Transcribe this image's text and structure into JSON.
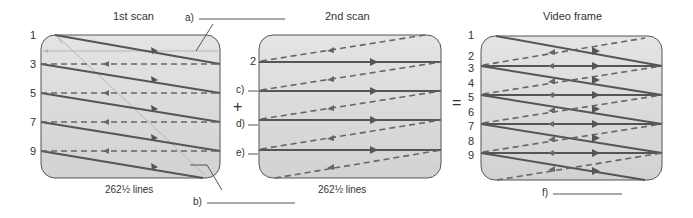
{
  "panels": [
    {
      "title": "1st scan",
      "caption": "262½ lines",
      "line_numbers": [
        "1",
        "3",
        "5",
        "7",
        "9"
      ]
    },
    {
      "title": "2nd scan",
      "caption": "262½ lines",
      "line_numbers": [
        "2"
      ]
    },
    {
      "title": "Video frame",
      "line_numbers": [
        "1",
        "2",
        "3",
        "4",
        "5",
        "6",
        "7",
        "8",
        "9"
      ]
    }
  ],
  "operators": {
    "plus": "+",
    "equals": "="
  },
  "blanks": {
    "a": "a)",
    "b": "b)",
    "c": "c)",
    "d": "d)",
    "e": "e)",
    "f": "f)"
  },
  "colors": {
    "box_fill": "#dcdcdc",
    "box_stroke": "#555555",
    "scan_line": "#555555",
    "retrace_line": "#666666",
    "vertical_retrace": "#b0b0b0"
  }
}
